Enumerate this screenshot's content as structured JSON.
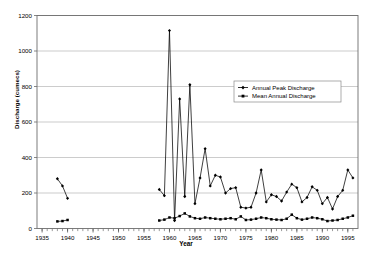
{
  "chart_data": {
    "type": "line",
    "title": "",
    "xlabel": "Year",
    "ylabel": "Discharge (cumecs)",
    "xlim": [
      1934,
      1997
    ],
    "ylim": [
      0,
      1200
    ],
    "grid": true,
    "legend_position": "inside-upper-right",
    "xticks": [
      1935,
      1940,
      1945,
      1950,
      1955,
      1960,
      1965,
      1970,
      1975,
      1980,
      1985,
      1990,
      1995
    ],
    "yticks": [
      0,
      200,
      400,
      600,
      800,
      1000,
      1200
    ],
    "series": [
      {
        "name": "Annual Peak Discharge",
        "marker": "filled-diamond",
        "color": "#000000",
        "points": [
          [
            1938,
            280
          ],
          [
            1939,
            240
          ],
          [
            1940,
            170
          ],
          [
            1958,
            220
          ],
          [
            1959,
            185
          ],
          [
            1960,
            1115
          ],
          [
            1961,
            45
          ],
          [
            1962,
            730
          ],
          [
            1963,
            180
          ],
          [
            1964,
            810
          ],
          [
            1965,
            140
          ],
          [
            1966,
            285
          ],
          [
            1967,
            450
          ],
          [
            1968,
            240
          ],
          [
            1969,
            300
          ],
          [
            1970,
            290
          ],
          [
            1971,
            200
          ],
          [
            1972,
            225
          ],
          [
            1973,
            230
          ],
          [
            1974,
            120
          ],
          [
            1975,
            115
          ],
          [
            1976,
            120
          ],
          [
            1977,
            200
          ],
          [
            1978,
            330
          ],
          [
            1979,
            150
          ],
          [
            1980,
            190
          ],
          [
            1981,
            180
          ],
          [
            1982,
            155
          ],
          [
            1983,
            205
          ],
          [
            1984,
            250
          ],
          [
            1985,
            230
          ],
          [
            1986,
            150
          ],
          [
            1987,
            175
          ],
          [
            1988,
            235
          ],
          [
            1989,
            215
          ],
          [
            1990,
            140
          ],
          [
            1991,
            175
          ],
          [
            1992,
            110
          ],
          [
            1993,
            180
          ],
          [
            1994,
            215
          ],
          [
            1995,
            330
          ],
          [
            1996,
            285
          ]
        ]
      },
      {
        "name": "Mean Annual Discharge",
        "marker": "filled-square",
        "color": "#000000",
        "points": [
          [
            1938,
            40
          ],
          [
            1939,
            42
          ],
          [
            1940,
            48
          ],
          [
            1958,
            45
          ],
          [
            1959,
            50
          ],
          [
            1960,
            62
          ],
          [
            1961,
            58
          ],
          [
            1962,
            70
          ],
          [
            1963,
            85
          ],
          [
            1964,
            68
          ],
          [
            1965,
            58
          ],
          [
            1966,
            55
          ],
          [
            1967,
            62
          ],
          [
            1968,
            58
          ],
          [
            1969,
            55
          ],
          [
            1970,
            52
          ],
          [
            1971,
            55
          ],
          [
            1972,
            58
          ],
          [
            1973,
            52
          ],
          [
            1974,
            68
          ],
          [
            1975,
            48
          ],
          [
            1976,
            50
          ],
          [
            1977,
            55
          ],
          [
            1978,
            62
          ],
          [
            1979,
            58
          ],
          [
            1980,
            52
          ],
          [
            1981,
            50
          ],
          [
            1982,
            48
          ],
          [
            1983,
            55
          ],
          [
            1984,
            78
          ],
          [
            1985,
            58
          ],
          [
            1986,
            50
          ],
          [
            1987,
            55
          ],
          [
            1988,
            62
          ],
          [
            1989,
            58
          ],
          [
            1990,
            52
          ],
          [
            1991,
            42
          ],
          [
            1992,
            45
          ],
          [
            1993,
            48
          ],
          [
            1994,
            55
          ],
          [
            1995,
            62
          ],
          [
            1996,
            72
          ]
        ]
      }
    ]
  },
  "axes": {
    "ylabel": "Discharge (cumecs)",
    "xlabel": "Year"
  },
  "legend": {
    "items": [
      {
        "label": "Annual Peak Discharge"
      },
      {
        "label": "Mean Annual Discharge"
      }
    ]
  }
}
